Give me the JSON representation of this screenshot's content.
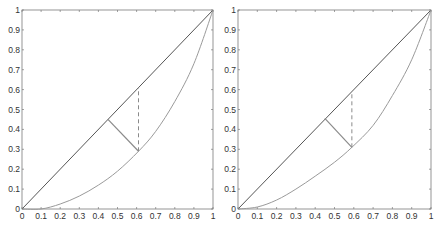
{
  "chart_data": [
    {
      "type": "line",
      "title": "",
      "xlabel": "",
      "ylabel": "",
      "xlim": [
        0,
        1
      ],
      "ylim": [
        0,
        1
      ],
      "grid": false,
      "legend": null,
      "xticks": [
        "0",
        "0.1",
        "0.2",
        "0.3",
        "0.4",
        "0.5",
        "0.6",
        "0.7",
        "0.8",
        "0.9",
        "1"
      ],
      "yticks": [
        "0",
        "0.1",
        "0.2",
        "0.3",
        "0.4",
        "0.5",
        "0.6",
        "0.7",
        "0.8",
        "0.9",
        "1"
      ],
      "series": [
        {
          "name": "diagonal",
          "style": "solid",
          "color": "#555555",
          "x": [
            0,
            1
          ],
          "y": [
            0,
            1
          ]
        },
        {
          "name": "curve",
          "style": "solid",
          "color": "#9a9a9a",
          "x": [
            0,
            0.1,
            0.2,
            0.3,
            0.4,
            0.5,
            0.61,
            0.7,
            0.8,
            0.9,
            1.0
          ],
          "y": [
            0,
            0.0,
            0.025,
            0.065,
            0.12,
            0.19,
            0.29,
            0.39,
            0.54,
            0.73,
            1.0
          ]
        },
        {
          "name": "perpendicular",
          "style": "solid",
          "color": "#8a8a8a",
          "x": [
            0.45,
            0.61
          ],
          "y": [
            0.45,
            0.29
          ]
        },
        {
          "name": "vertical-gap",
          "style": "dashed",
          "color": "#8a8a8a",
          "x": [
            0.61,
            0.61
          ],
          "y": [
            0.29,
            0.61
          ]
        }
      ]
    },
    {
      "type": "line",
      "title": "",
      "xlabel": "",
      "ylabel": "",
      "xlim": [
        0,
        1
      ],
      "ylim": [
        0,
        1
      ],
      "grid": false,
      "legend": null,
      "xticks": [
        "0",
        "0.1",
        "0.2",
        "0.3",
        "0.4",
        "0.5",
        "0.6",
        "0.7",
        "0.8",
        "0.9",
        "1"
      ],
      "yticks": [
        "0",
        "0.1",
        "0.2",
        "0.3",
        "0.4",
        "0.5",
        "0.6",
        "0.7",
        "0.8",
        "0.9",
        "1"
      ],
      "series": [
        {
          "name": "diagonal",
          "style": "solid",
          "color": "#555555",
          "x": [
            0,
            1
          ],
          "y": [
            0,
            1
          ]
        },
        {
          "name": "curve",
          "style": "solid",
          "color": "#9a9a9a",
          "x": [
            0,
            0.1,
            0.2,
            0.3,
            0.4,
            0.5,
            0.59,
            0.7,
            0.8,
            0.9,
            1.0
          ],
          "y": [
            0,
            0.01,
            0.045,
            0.1,
            0.165,
            0.235,
            0.31,
            0.42,
            0.57,
            0.75,
            1.0
          ]
        },
        {
          "name": "perpendicular",
          "style": "solid",
          "color": "#8a8a8a",
          "x": [
            0.45,
            0.59
          ],
          "y": [
            0.455,
            0.31
          ]
        },
        {
          "name": "vertical-gap",
          "style": "dashed",
          "color": "#8a8a8a",
          "x": [
            0.59,
            0.59
          ],
          "y": [
            0.31,
            0.58
          ]
        }
      ]
    }
  ],
  "panels": [
    {
      "plot": {
        "left": 22,
        "top": 10,
        "right": 213,
        "bottom": 209
      }
    },
    {
      "plot": {
        "left": 238,
        "top": 10,
        "right": 431,
        "bottom": 209
      }
    }
  ]
}
